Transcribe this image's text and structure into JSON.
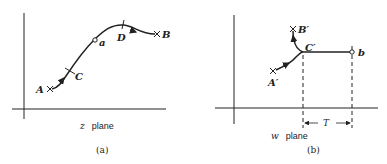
{
  "panels": [
    {
      "id": "a",
      "caption": "(a)",
      "plane_var": "z",
      "plane_word": "plane",
      "points": {
        "A": "A",
        "B": "B",
        "C": "C",
        "D": "D",
        "a": "a"
      }
    },
    {
      "id": "b",
      "caption": "(b)",
      "plane_var": "w",
      "plane_word": "plane",
      "points": {
        "A": "A′",
        "B": "B′",
        "C": "C′",
        "b": "b"
      },
      "dimension_label": "T"
    }
  ],
  "colors": {
    "ink": "#222222",
    "background": "#ffffff"
  }
}
